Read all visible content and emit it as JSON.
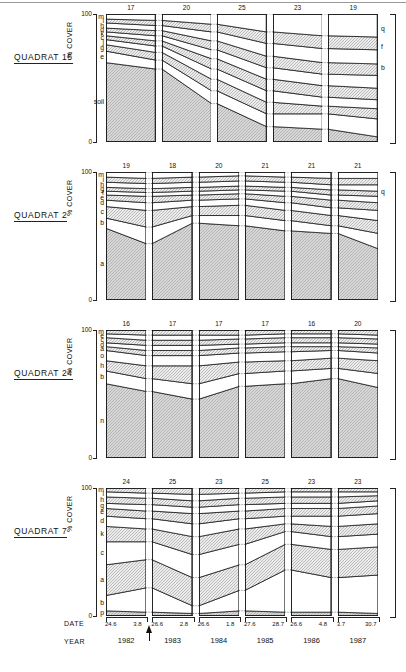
{
  "axis": {
    "cover_label": "% COVER",
    "tick_top": "100",
    "tick_bottom": "0",
    "date_caption": "DATE",
    "year_caption": "YEAR"
  },
  "years": [
    "1982",
    "1983",
    "1984",
    "1985",
    "1986",
    "1987"
  ],
  "dates": [
    {
      "start": "24.6",
      "end": "3.8"
    },
    {
      "start": "26.6",
      "end": "2.8"
    },
    {
      "start": "26.6",
      "end": "1.8"
    },
    {
      "start": "27.6",
      "end": "28.7"
    },
    {
      "start": "26.6",
      "end": "4.8"
    },
    {
      "start": "3.7",
      "end": "30.7"
    }
  ],
  "panels": [
    {
      "title": "QUADRAT 15",
      "counts": [
        "17",
        "20",
        "25",
        "23",
        "19"
      ],
      "left_labels": [
        "m",
        "i",
        "h",
        "d",
        "k",
        "c",
        "j",
        "g",
        "e",
        "soil"
      ],
      "right_labels": [
        "q",
        "f",
        "b"
      ]
    },
    {
      "title": "QUADRAT 2",
      "counts": [
        "19",
        "18",
        "20",
        "21",
        "21",
        "21"
      ],
      "left_labels": [
        "m",
        "i",
        "h",
        "g",
        "f",
        "e",
        "d",
        "c",
        "b",
        "a"
      ],
      "right_labels": [
        "q"
      ]
    },
    {
      "title": "QUADRAT 24",
      "counts": [
        "16",
        "17",
        "17",
        "17",
        "16",
        "20"
      ],
      "left_labels": [
        "m",
        "e",
        "c",
        "d",
        "a",
        "o",
        "h",
        "b",
        "n"
      ],
      "right_labels": []
    },
    {
      "title": "QUADRAT 7",
      "counts": [
        "24",
        "25",
        "23",
        "25",
        "23",
        "23"
      ],
      "left_labels": [
        "m",
        "i",
        "h",
        "g",
        "e",
        "d",
        "k",
        "c",
        "a",
        "b",
        "p"
      ],
      "right_labels": []
    }
  ],
  "chart_data": {
    "type": "area",
    "xlabel": "YEAR",
    "ylabel": "% COVER",
    "ylim": [
      0,
      100
    ],
    "grid": false,
    "legend": "inline-labels",
    "x": [
      "1982",
      "1983",
      "1984",
      "1985",
      "1986",
      "1987"
    ],
    "note": "Each year column is drawn as a pair of start/end dates; values are cumulative percentage cover boundaries read from the stacked bands (bottom band first).",
    "panels": [
      {
        "name": "QUADRAT 15",
        "species_count": [
          17,
          20,
          25,
          23,
          19
        ],
        "columns_present": [
          "1982",
          "1983",
          "1984",
          "1985",
          "1986"
        ],
        "series": [
          {
            "name": "soil",
            "start": [
              62,
              57,
              30,
              12,
              10
            ],
            "end": [
              57,
              30,
              12,
              10,
              4
            ]
          },
          {
            "name": "e",
            "start": [
              71,
              64,
              40,
              22,
              22
            ],
            "end": [
              64,
              40,
              22,
              22,
              18
            ]
          },
          {
            "name": "g",
            "start": [
              76,
              70,
              49,
              31,
              28
            ],
            "end": [
              70,
              49,
              31,
              28,
              26
            ]
          },
          {
            "name": "j",
            "start": [
              80,
              75,
              57,
              40,
              35
            ],
            "end": [
              75,
              57,
              40,
              35,
              33
            ]
          },
          {
            "name": "c",
            "start": [
              83,
              79,
              65,
              49,
              44
            ],
            "end": [
              79,
              65,
              49,
              44,
              42
            ]
          },
          {
            "name": "k",
            "start": [
              86,
              83,
              72,
              58,
              53
            ],
            "end": [
              83,
              72,
              58,
              53,
              52
            ]
          },
          {
            "name": "d",
            "start": [
              89,
              87,
              79,
              67,
              62
            ],
            "end": [
              87,
              79,
              67,
              62,
              61
            ]
          },
          {
            "name": "h",
            "start": [
              93,
              91,
              86,
              77,
              73
            ],
            "end": [
              91,
              86,
              77,
              73,
              72
            ]
          },
          {
            "name": "i",
            "start": [
              96,
              95,
              92,
              86,
              83
            ],
            "end": [
              95,
              92,
              86,
              83,
              82
            ]
          },
          {
            "name": "m",
            "start": [
              100,
              100,
              100,
              100,
              100
            ],
            "end": [
              100,
              100,
              100,
              100,
              100
            ]
          }
        ]
      },
      {
        "name": "QUADRAT 2",
        "species_count": [
          19,
          18,
          20,
          21,
          21,
          21
        ],
        "columns_present": [
          "1982",
          "1983",
          "1984",
          "1985",
          "1986",
          "1987"
        ],
        "series": [
          {
            "name": "a",
            "start": [
              56,
              44,
              60,
              58,
              54,
              52
            ],
            "end": [
              44,
              60,
              58,
              54,
              52,
              40
            ]
          },
          {
            "name": "b",
            "start": [
              64,
              57,
              66,
              66,
              62,
              58
            ],
            "end": [
              57,
              66,
              66,
              62,
              58,
              52
            ]
          },
          {
            "name": "c",
            "start": [
              73,
              70,
              73,
              74,
              70,
              66
            ],
            "end": [
              70,
              73,
              74,
              70,
              66,
              62
            ]
          },
          {
            "name": "d",
            "start": [
              78,
              76,
              78,
              79,
              76,
              72
            ],
            "end": [
              76,
              78,
              79,
              76,
              72,
              70
            ]
          },
          {
            "name": "e",
            "start": [
              82,
              81,
              82,
              83,
              81,
              78
            ],
            "end": [
              81,
              82,
              83,
              81,
              78,
              76
            ]
          },
          {
            "name": "f",
            "start": [
              85,
              84,
              85,
              86,
              85,
              82
            ],
            "end": [
              84,
              85,
              86,
              85,
              82,
              81
            ]
          },
          {
            "name": "g",
            "start": [
              88,
              87,
              88,
              89,
              88,
              86
            ],
            "end": [
              87,
              88,
              89,
              88,
              86,
              85
            ]
          },
          {
            "name": "h",
            "start": [
              92,
              91,
              92,
              93,
              92,
              90
            ],
            "end": [
              91,
              92,
              93,
              92,
              90,
              90
            ]
          },
          {
            "name": "i",
            "start": [
              96,
              95,
              96,
              97,
              96,
              95
            ],
            "end": [
              95,
              96,
              97,
              96,
              95,
              95
            ]
          },
          {
            "name": "m",
            "start": [
              100,
              100,
              100,
              100,
              100,
              100
            ],
            "end": [
              100,
              100,
              100,
              100,
              100,
              100
            ]
          }
        ]
      },
      {
        "name": "QUADRAT 24",
        "species_count": [
          16,
          17,
          17,
          17,
          16,
          20
        ],
        "columns_present": [
          "1982",
          "1983",
          "1984",
          "1985",
          "1986",
          "1987"
        ],
        "series": [
          {
            "name": "n",
            "start": [
              58,
              52,
              46,
              56,
              58,
              62
            ],
            "end": [
              52,
              46,
              56,
              58,
              62,
              55
            ]
          },
          {
            "name": "b",
            "start": [
              68,
              62,
              58,
              66,
              68,
              70
            ],
            "end": [
              62,
              58,
              66,
              68,
              70,
              66
            ]
          },
          {
            "name": "h",
            "start": [
              76,
              72,
              72,
              75,
              76,
              78
            ],
            "end": [
              72,
              72,
              75,
              76,
              78,
              76
            ]
          },
          {
            "name": "o",
            "start": [
              84,
              80,
              80,
              82,
              83,
              84
            ],
            "end": [
              80,
              80,
              82,
              83,
              84,
              82
            ]
          },
          {
            "name": "a",
            "start": [
              87,
              84,
              84,
              86,
              87,
              87
            ],
            "end": [
              84,
              84,
              86,
              87,
              87,
              86
            ]
          },
          {
            "name": "d",
            "start": [
              90,
              88,
              88,
              89,
              90,
              90
            ],
            "end": [
              88,
              88,
              89,
              90,
              90,
              89
            ]
          },
          {
            "name": "c",
            "start": [
              94,
              92,
              92,
              93,
              94,
              94
            ],
            "end": [
              92,
              92,
              93,
              94,
              94,
              93
            ]
          },
          {
            "name": "e",
            "start": [
              97,
              96,
              96,
              96,
              97,
              97
            ],
            "end": [
              96,
              96,
              96,
              97,
              97,
              96
            ]
          },
          {
            "name": "m",
            "start": [
              100,
              100,
              100,
              100,
              100,
              100
            ],
            "end": [
              100,
              100,
              100,
              100,
              100,
              100
            ]
          }
        ]
      },
      {
        "name": "QUADRAT 7",
        "species_count": [
          24,
          25,
          23,
          25,
          23,
          23
        ],
        "columns_present": [
          "1982",
          "1983",
          "1984",
          "1985",
          "1986",
          "1987"
        ],
        "series": [
          {
            "name": "p",
            "start": [
              4,
              3,
              2,
              4,
              3,
              3
            ],
            "end": [
              3,
              2,
              4,
              3,
              3,
              2
            ]
          },
          {
            "name": "b",
            "start": [
              16,
              22,
              8,
              20,
              36,
              30
            ],
            "end": [
              22,
              8,
              20,
              36,
              30,
              32
            ]
          },
          {
            "name": "a",
            "start": [
              40,
              44,
              30,
              40,
              56,
              52
            ],
            "end": [
              44,
              30,
              40,
              56,
              52,
              54
            ]
          },
          {
            "name": "c",
            "start": [
              58,
              58,
              48,
              56,
              66,
              62
            ],
            "end": [
              58,
              48,
              56,
              66,
              62,
              64
            ]
          },
          {
            "name": "k",
            "start": [
              70,
              68,
              62,
              68,
              72,
              70
            ],
            "end": [
              68,
              62,
              68,
              72,
              70,
              72
            ]
          },
          {
            "name": "d",
            "start": [
              78,
              76,
              72,
              76,
              78,
              78
            ],
            "end": [
              76,
              72,
              76,
              78,
              78,
              80
            ]
          },
          {
            "name": "e",
            "start": [
              84,
              82,
              80,
              82,
              84,
              84
            ],
            "end": [
              82,
              80,
              82,
              84,
              84,
              86
            ]
          },
          {
            "name": "g",
            "start": [
              88,
              87,
              85,
              87,
              88,
              88
            ],
            "end": [
              87,
              85,
              87,
              88,
              88,
              90
            ]
          },
          {
            "name": "h",
            "start": [
              93,
              92,
              90,
              92,
              93,
              93
            ],
            "end": [
              92,
              90,
              92,
              93,
              93,
              94
            ]
          },
          {
            "name": "i",
            "start": [
              97,
              96,
              95,
              96,
              97,
              97
            ],
            "end": [
              96,
              95,
              96,
              97,
              97,
              97
            ]
          },
          {
            "name": "m",
            "start": [
              100,
              100,
              100,
              100,
              100,
              100
            ],
            "end": [
              100,
              100,
              100,
              100,
              100,
              100
            ]
          }
        ]
      }
    ]
  }
}
